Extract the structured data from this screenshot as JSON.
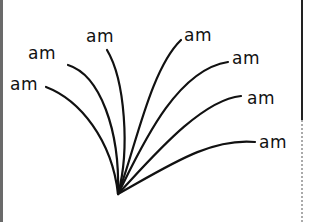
{
  "diagram": {
    "origin_point": {
      "x": 118,
      "y": 194
    },
    "stroke_color": "#111111",
    "labels": [
      {
        "text": "am",
        "x": 10,
        "y": 78
      },
      {
        "text": "am",
        "x": 28,
        "y": 47
      },
      {
        "text": "am",
        "x": 86,
        "y": 28
      },
      {
        "text": "am",
        "x": 184,
        "y": 28
      },
      {
        "text": "am",
        "x": 234,
        "y": 50
      },
      {
        "text": "am",
        "x": 247,
        "y": 91
      },
      {
        "text": "am",
        "x": 260,
        "y": 135
      }
    ]
  }
}
